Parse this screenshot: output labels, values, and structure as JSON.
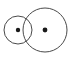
{
  "canvas": {
    "width": 75,
    "height": 60,
    "background_color": "#ffffff"
  },
  "diagram": {
    "type": "two-overlapping-circles",
    "stroke_color": "#4a4a4a",
    "stroke_width": 1,
    "dot_color": "#1a1a1a",
    "fill": "none",
    "shapes": [
      {
        "name": "small-circle",
        "kind": "circle",
        "cx": 18,
        "cy": 30,
        "r": 14,
        "stroke": "#4a4a4a",
        "fill": "none"
      },
      {
        "name": "large-circle",
        "kind": "circle",
        "cx": 45,
        "cy": 30,
        "r": 22,
        "stroke": "#4a4a4a",
        "fill": "none"
      },
      {
        "name": "small-circle-center-dot",
        "kind": "dot",
        "cx": 18,
        "cy": 30,
        "r": 2.2,
        "fill": "#1a1a1a"
      },
      {
        "name": "large-circle-center-dot",
        "kind": "dot",
        "cx": 45,
        "cy": 30,
        "r": 2.4,
        "fill": "#1a1a1a"
      }
    ],
    "labels": []
  }
}
